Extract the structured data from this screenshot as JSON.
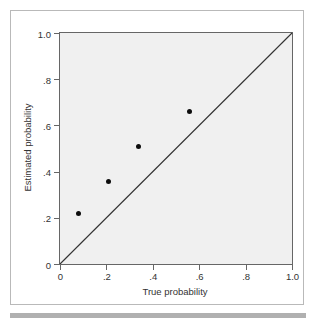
{
  "chart_data": {
    "type": "scatter",
    "title": "",
    "xlabel": "True probability",
    "ylabel": "Estimated probability",
    "xlim": [
      0,
      1.0
    ],
    "ylim": [
      0,
      1.0
    ],
    "grid": false,
    "legend": null,
    "xticks": [
      0,
      0.2,
      0.4,
      0.6,
      0.8,
      1.0
    ],
    "xtick_labels": [
      "0",
      ".2",
      ".4",
      ".6",
      ".8",
      "1.0"
    ],
    "yticks": [
      0,
      0.2,
      0.4,
      0.6,
      0.8,
      1.0
    ],
    "ytick_labels": [
      "0",
      ".2",
      ".4",
      ".6",
      ".8",
      "1.0"
    ],
    "series": [
      {
        "name": "Estimated vs true probability",
        "marker": "filled-circle",
        "color": "#0d0d0d",
        "points": [
          {
            "x": 0.08,
            "y": 0.22
          },
          {
            "x": 0.21,
            "y": 0.355
          },
          {
            "x": 0.34,
            "y": 0.51
          },
          {
            "x": 0.56,
            "y": 0.66
          }
        ]
      }
    ],
    "reference_line": {
      "name": "identity-line",
      "from": {
        "x": 0,
        "y": 0
      },
      "to": {
        "x": 1.0,
        "y": 1.0
      },
      "color": "#333333"
    },
    "colors": {
      "plot_background": "#f0f0f0",
      "axis": "#666666",
      "text": "#333333",
      "marker": "#0d0d0d",
      "card_border": "#b9b9b9",
      "bottom_rule": "#b0b0b0"
    }
  }
}
